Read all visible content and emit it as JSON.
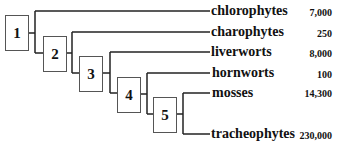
{
  "diagram": {
    "type": "cladogram",
    "nodes": [
      "1",
      "2",
      "3",
      "4",
      "5"
    ],
    "taxa": [
      {
        "name": "chlorophytes",
        "count": "7,000"
      },
      {
        "name": "charophytes",
        "count": "250"
      },
      {
        "name": "liverworts",
        "count": "8,000"
      },
      {
        "name": "hornworts",
        "count": "100"
      },
      {
        "name": "mosses",
        "count": "14,300"
      },
      {
        "name": "tracheophytes",
        "count": "230,000"
      }
    ],
    "line_color": "#222222"
  }
}
